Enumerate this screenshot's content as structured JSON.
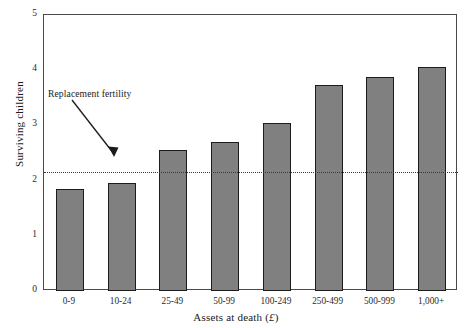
{
  "chart_data": {
    "type": "bar",
    "title": "",
    "subtitle": "",
    "xlabel": "Assets at death (£)",
    "ylabel": "Surviving children",
    "categories": [
      "0-9",
      "10-24",
      "25-49",
      "50-99",
      "100-249",
      "250-499",
      "500-999",
      "1,000+"
    ],
    "values": [
      1.85,
      1.95,
      2.55,
      2.7,
      3.05,
      3.73,
      3.87,
      4.05
    ],
    "ylim": [
      0,
      5
    ],
    "yticks": [
      0,
      1,
      2,
      3,
      4,
      5
    ],
    "ytick_labels": [
      "0",
      "1",
      "2",
      "3",
      "4",
      "5"
    ],
    "grid": false,
    "legend": "none",
    "bar_color": "#808080",
    "bar_edge_color": "#1c1c1c",
    "annotations": [
      {
        "text": "Replacement fertility",
        "kind": "arrow-label",
        "points_to_value": 2.15
      }
    ],
    "reference_lines": [
      {
        "name": "replacement-fertility",
        "value": 2.15,
        "style": "dotted",
        "color": "#3a3a3a"
      }
    ]
  },
  "axis": {
    "y_title": "Surviving children",
    "x_title_main": "Assets at death (",
    "x_title_currency": "£",
    "x_title_end": ")"
  }
}
